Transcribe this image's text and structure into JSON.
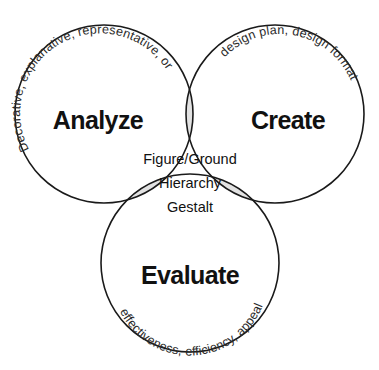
{
  "diagram": {
    "type": "venn-3-circle",
    "background_color": "#ffffff",
    "outline_color": "#1a1a1a",
    "pair_intersection_fill": "#e2e2e2",
    "center_intersection_fill": "#fafafa",
    "sets": [
      {
        "id": "analyze",
        "label": "Analyze",
        "descriptor": "Decorative, explanative, representative, organizational",
        "position": "top-left"
      },
      {
        "id": "create",
        "label": "Create",
        "descriptor": "design plan, design format",
        "position": "top-right"
      },
      {
        "id": "evaluate",
        "label": "Evaluate",
        "descriptor": "effectiveness, efficiency, appeal",
        "position": "bottom-center"
      }
    ],
    "center": {
      "lines": [
        "Figure/Ground",
        "Hierarchy",
        "Gestalt"
      ]
    }
  }
}
